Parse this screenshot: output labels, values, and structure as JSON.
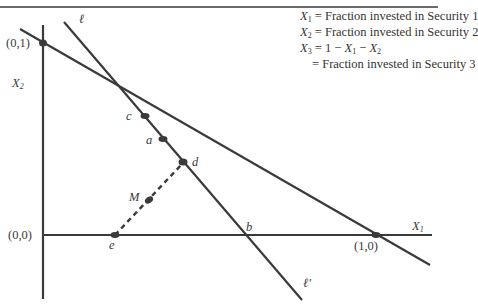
{
  "legend": {
    "x1_symbol": "X",
    "x1_sub": "1",
    "x1_def": " = Fraction invested in Security 1",
    "x2_symbol": "X",
    "x2_sub": "2",
    "x2_def": " = Fraction invested in Security 2",
    "x3_symbol": "X",
    "x3_sub": "3",
    "x3_def_prefix": " = 1 − ",
    "x3_def_a": "X",
    "x3_def_a_sub": "1",
    "x3_def_mid": " − ",
    "x3_def_b": "X",
    "x3_def_b_sub": "2",
    "x3_def_cont": "= Fraction invested in Security 3"
  },
  "axes": {
    "x_label": "X",
    "x_label_sub": "1",
    "y_label": "X",
    "y_label_sub": "2",
    "origin_label": "(0,0)",
    "y_intercept_label": "(0,1)",
    "x_intercept_label": "(1,0)"
  },
  "lines": {
    "ell_top": "ℓ",
    "ell_bottom": "ℓ′"
  },
  "points": {
    "c": "c",
    "a": "a",
    "d": "d",
    "M": "M",
    "e": "e",
    "b": "b"
  },
  "colors": {
    "ink": "#3a3a3a",
    "background": "#ffffff"
  }
}
